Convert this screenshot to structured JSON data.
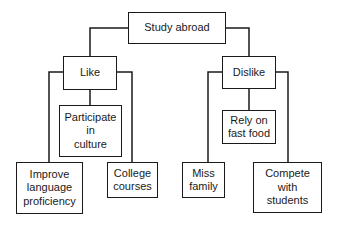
{
  "diagram": {
    "type": "tree",
    "root": {
      "label": "Study abroad",
      "children": [
        {
          "label": "Like",
          "children": [
            {
              "label": "Participate\nin\nculture"
            },
            {
              "label": "Improve\nlanguage\nproficiency"
            },
            {
              "label": "College\ncourses"
            }
          ]
        },
        {
          "label": "Dislike",
          "children": [
            {
              "label": "Rely on\nfast food"
            },
            {
              "label": "Miss\nfamily"
            },
            {
              "label": "Compete\nwith\nstudents"
            }
          ]
        }
      ]
    },
    "colors": {
      "line": "#1a1a1a",
      "box_fill": "#ffffff",
      "background": "#ffffff"
    }
  }
}
